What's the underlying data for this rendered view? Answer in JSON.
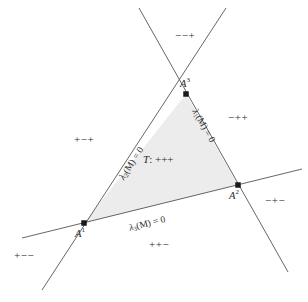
{
  "figure": {
    "name": "triangle-barycentric-sign-regions",
    "fill_color": "#ececec",
    "line_color": "#555555",
    "vertices": [
      {
        "id": "A1",
        "label": "A",
        "superscript": "1",
        "x": 84,
        "y": 223
      },
      {
        "id": "A2",
        "label": "A",
        "superscript": "2",
        "x": 238,
        "y": 185
      },
      {
        "id": "A3",
        "label": "A",
        "superscript": "3",
        "x": 186,
        "y": 94
      }
    ],
    "lines": [
      {
        "id": "l1",
        "equation_lambda": "λ",
        "subscript": "1",
        "equation": "(M) = 0",
        "x1": 139,
        "y1": 8,
        "x2": 288,
        "y2": 272
      },
      {
        "id": "l2",
        "equation_lambda": "λ",
        "subscript": "2",
        "equation": "(M) = 0",
        "x1": 226,
        "y1": 8,
        "x2": 42,
        "y2": 290
      },
      {
        "id": "l3",
        "equation_lambda": "λ",
        "subscript": "3",
        "equation": "(M) = 0",
        "x1": 22,
        "y1": 238,
        "x2": 302,
        "y2": 169
      }
    ],
    "interior_label": {
      "symbol": "T",
      "separator": ":",
      "signs": "+++"
    },
    "region_labels": [
      {
        "id": "region-top",
        "text": "−−+",
        "x": 175,
        "y": 29
      },
      {
        "id": "region-right-upper",
        "text": "−++",
        "x": 228,
        "y": 111
      },
      {
        "id": "region-left",
        "text": "+−+",
        "x": 74,
        "y": 133
      },
      {
        "id": "region-right-lower",
        "text": "−+−",
        "x": 265,
        "y": 194
      },
      {
        "id": "region-bottom",
        "text": "++−",
        "x": 149,
        "y": 238
      },
      {
        "id": "region-bottom-left",
        "text": "+−−",
        "x": 14,
        "y": 249
      }
    ]
  }
}
